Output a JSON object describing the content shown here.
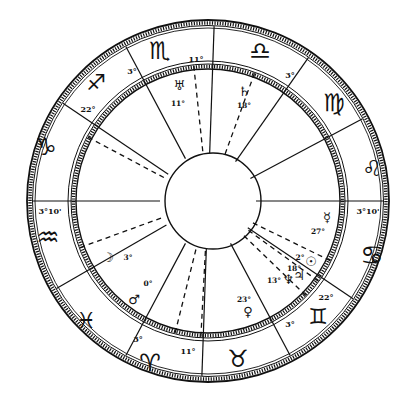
{
  "chart": {
    "type": "horoscope-wheel",
    "center": [
      208,
      201
    ],
    "colors": {
      "ink": "#111111",
      "paper": "#ffffff"
    },
    "signs": [
      {
        "name": "aquarius",
        "glyph": "♒",
        "pos": [
          48,
          238
        ],
        "size": 26
      },
      {
        "name": "capricorn",
        "glyph": "♑",
        "pos": [
          46,
          148
        ],
        "size": 24
      },
      {
        "name": "sagittarius",
        "glyph": "♐",
        "pos": [
          96,
          84
        ],
        "size": 22
      },
      {
        "name": "scorpio",
        "glyph": "♏",
        "pos": [
          160,
          52
        ],
        "size": 24
      },
      {
        "name": "libra",
        "glyph": "♎",
        "pos": [
          260,
          52
        ],
        "size": 24
      },
      {
        "name": "virgo",
        "glyph": "♍",
        "pos": [
          334,
          104
        ],
        "size": 24
      },
      {
        "name": "leo",
        "glyph": "♌",
        "pos": [
          372,
          170
        ],
        "size": 22
      },
      {
        "name": "cancer",
        "glyph": "♋",
        "pos": [
          372,
          256
        ],
        "size": 26
      },
      {
        "name": "gemini",
        "glyph": "♊",
        "pos": [
          318,
          318
        ],
        "size": 22
      },
      {
        "name": "taurus",
        "glyph": "♉",
        "pos": [
          238,
          360
        ],
        "size": 24
      },
      {
        "name": "aries",
        "glyph": "♈",
        "pos": [
          150,
          364
        ],
        "size": 24
      },
      {
        "name": "pisces",
        "glyph": "♓",
        "pos": [
          86,
          322
        ],
        "size": 22
      }
    ],
    "cusps": [
      {
        "angle": 180,
        "label": "3°10'",
        "label_pos": [
          50,
          212
        ]
      },
      {
        "angle": 146,
        "label": "22°",
        "label_pos": [
          88,
          110
        ]
      },
      {
        "angle": 118,
        "label": "3°",
        "label_pos": [
          132,
          72
        ]
      },
      {
        "angle": 88,
        "label": "11°",
        "label_pos": [
          196,
          60
        ]
      },
      {
        "angle": 55,
        "label": "3°",
        "label_pos": [
          290,
          76
        ]
      },
      {
        "angle": 28,
        "label": "",
        "label_pos": [
          0,
          0
        ]
      },
      {
        "angle": 0,
        "label": "3°10'",
        "label_pos": [
          368,
          212
        ]
      },
      {
        "angle": -34,
        "label": "22°",
        "label_pos": [
          326,
          298
        ]
      },
      {
        "angle": -62,
        "label": "3°",
        "label_pos": [
          290,
          325
        ]
      },
      {
        "angle": -92,
        "label": "11°",
        "label_pos": [
          188,
          352
        ]
      },
      {
        "angle": -118,
        "label": "3°",
        "label_pos": [
          138,
          340
        ]
      },
      {
        "angle": -150,
        "label": "",
        "label_pos": [
          0,
          0
        ]
      }
    ],
    "planet_lines": [
      152,
      96,
      70,
      -26,
      -36,
      -44,
      -93,
      -104,
      -160
    ],
    "planets": [
      {
        "name": "uranus",
        "glyph": "♅",
        "degree": "11°",
        "glyph_pos": [
          179,
          86
        ],
        "degree_pos": [
          178,
          104
        ]
      },
      {
        "name": "saturn",
        "glyph": "♄",
        "degree": "18°",
        "glyph_pos": [
          244,
          92
        ],
        "degree_pos": [
          244,
          106
        ]
      },
      {
        "name": "moon",
        "glyph": "☽",
        "degree": "3°",
        "glyph_pos": [
          108,
          258
        ],
        "degree_pos": [
          128,
          258
        ]
      },
      {
        "name": "mars",
        "glyph": "♂",
        "degree": "0°",
        "glyph_pos": [
          134,
          300
        ],
        "degree_pos": [
          148,
          284
        ]
      },
      {
        "name": "venus",
        "glyph": "♀",
        "degree": "23°",
        "glyph_pos": [
          248,
          312
        ],
        "degree_pos": [
          244,
          300
        ]
      },
      {
        "name": "mercury",
        "glyph": "☿",
        "degree": "27°",
        "glyph_pos": [
          327,
          218
        ],
        "degree_pos": [
          318,
          232
        ]
      },
      {
        "name": "sun",
        "glyph": "☉",
        "degree": "2°",
        "glyph_pos": [
          311,
          262
        ],
        "degree_pos": [
          300,
          258
        ]
      },
      {
        "name": "neptune",
        "glyph": "♆",
        "degree": "13°",
        "glyph_pos": [
          288,
          280
        ],
        "degree_pos": [
          274,
          281
        ]
      },
      {
        "name": "jupiter",
        "glyph": "♃",
        "degree": "18°",
        "glyph_pos": [
          299,
          276
        ],
        "degree_pos": [
          294,
          269
        ]
      }
    ]
  }
}
